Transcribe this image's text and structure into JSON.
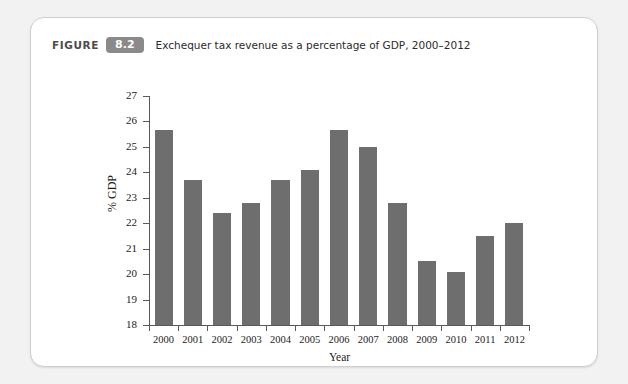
{
  "figure": {
    "label": "FIGURE",
    "number": "8.2",
    "caption": "Exchequer tax revenue as a percentage of GDP, 2000–2012"
  },
  "colors": {
    "bar": "#6e6e6e",
    "axis": "#595959",
    "badge": "#8a8a8a",
    "card_border": "#cfcfcf",
    "page_background": "#f2f2f2",
    "plot_background": "#ffffff"
  },
  "chart_data": {
    "type": "bar",
    "title": "Exchequer tax revenue as a percentage of GDP, 2000–2012",
    "xlabel": "Year",
    "ylabel": "% GDP",
    "categories": [
      "2000",
      "2001",
      "2002",
      "2003",
      "2004",
      "2005",
      "2006",
      "2007",
      "2008",
      "2009",
      "2010",
      "2011",
      "2012"
    ],
    "values": [
      25.65,
      23.7,
      22.4,
      22.8,
      23.7,
      24.1,
      25.65,
      25.0,
      22.8,
      20.5,
      20.1,
      21.5,
      22.0
    ],
    "ylim": [
      18,
      27
    ],
    "ytick_labels": [
      "27",
      "26",
      "25",
      "24",
      "23",
      "22",
      "21",
      "20",
      "19",
      "18"
    ],
    "yticks": [
      27,
      26,
      25,
      24,
      23,
      22,
      21,
      20,
      19,
      18
    ],
    "grid": false,
    "legend": false
  }
}
